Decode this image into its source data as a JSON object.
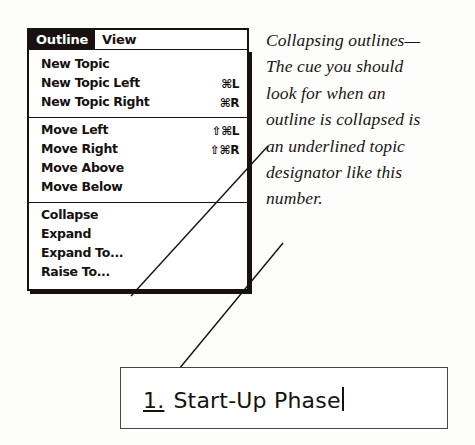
{
  "menu": {
    "menubar": [
      {
        "label": "Outline",
        "selected": true
      },
      {
        "label": "View",
        "selected": false
      }
    ],
    "groups": [
      {
        "items": [
          {
            "label": "New Topic",
            "shortcut": ""
          },
          {
            "label": "New Topic Left",
            "shortcut": "⌘L"
          },
          {
            "label": "New Topic Right",
            "shortcut": "⌘R"
          }
        ]
      },
      {
        "items": [
          {
            "label": "Move Left",
            "shortcut": "⇧⌘L"
          },
          {
            "label": "Move Right",
            "shortcut": "⇧⌘R"
          },
          {
            "label": "Move Above",
            "shortcut": ""
          },
          {
            "label": "Move Below",
            "shortcut": ""
          }
        ]
      },
      {
        "items": [
          {
            "label": "Collapse",
            "shortcut": ""
          },
          {
            "label": "Expand",
            "shortcut": ""
          },
          {
            "label": "Expand To...",
            "shortcut": ""
          },
          {
            "label": "Raise To...",
            "shortcut": ""
          }
        ]
      }
    ]
  },
  "annotation": {
    "lines": [
      "Collapsing outlines—",
      "The cue you should",
      "look for when an",
      "outline is collapsed is",
      "an underlined topic",
      "designator like this",
      "number."
    ]
  },
  "topic_box": {
    "designator": "1.",
    "text": "Start-Up Phase"
  },
  "colors": {
    "ink": "#17110f",
    "paper": "#fdfdfc",
    "box_border": "#4a4643"
  }
}
